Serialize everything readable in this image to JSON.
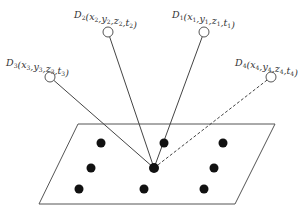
{
  "diagram": {
    "type": "multi-station positioning schematic",
    "plane": {
      "points": [
        [
          78,
          124
        ],
        [
          275,
          124
        ],
        [
          235,
          204
        ],
        [
          39,
          204
        ]
      ],
      "stroke": "#555555"
    },
    "target": {
      "x": 154,
      "y": 168,
      "r": 5
    },
    "grid_points": [
      {
        "x": 101,
        "y": 143
      },
      {
        "x": 164,
        "y": 143
      },
      {
        "x": 223,
        "y": 143
      },
      {
        "x": 91,
        "y": 168
      },
      {
        "x": 214,
        "y": 168
      },
      {
        "x": 79,
        "y": 189
      },
      {
        "x": 144,
        "y": 189
      },
      {
        "x": 204,
        "y": 189
      }
    ],
    "dot_color": "#111111",
    "stations": [
      {
        "id": "D3",
        "name": "D",
        "index": "3",
        "coords": [
          "x",
          "y",
          "z",
          "t"
        ],
        "sub": "3",
        "cx": 50,
        "cy": 77,
        "lx": 6,
        "ly": 66,
        "line": "solid"
      },
      {
        "id": "D2",
        "name": "D",
        "index": "2",
        "coords": [
          "x",
          "y",
          "z",
          "t"
        ],
        "sub": "2",
        "cx": 108,
        "cy": 32,
        "lx": 74,
        "ly": 18,
        "line": "solid"
      },
      {
        "id": "D1",
        "name": "D",
        "index": "1",
        "coords": [
          "x",
          "y",
          "z",
          "t"
        ],
        "sub": "1",
        "cx": 204,
        "cy": 32,
        "lx": 172,
        "ly": 18,
        "line": "solid"
      },
      {
        "id": "D4",
        "name": "D",
        "index": "4",
        "coords": [
          "x",
          "y",
          "z",
          "t"
        ],
        "sub": "4",
        "cx": 271,
        "cy": 77,
        "lx": 235,
        "ly": 66,
        "line": "dashed"
      }
    ],
    "station_radius": 5
  }
}
